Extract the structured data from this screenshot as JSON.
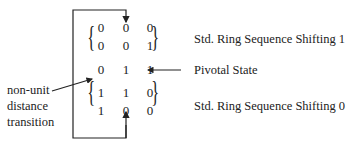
{
  "diagram": {
    "rows": [
      {
        "bits": [
          "0",
          "0",
          "0"
        ],
        "group": "shift1"
      },
      {
        "bits": [
          "0",
          "0",
          "1"
        ],
        "group": "shift1"
      },
      {
        "bits": [
          "0",
          "1",
          "1"
        ],
        "group": "pivot"
      },
      {
        "bits": [
          "1",
          "1",
          "0"
        ],
        "group": "shift0"
      },
      {
        "bits": [
          "1",
          "0",
          "0"
        ],
        "group": "shift0"
      }
    ],
    "labels": {
      "shift1": "Std. Ring Sequence Shifting 1",
      "pivot": "Pivotal State",
      "shift0": "Std. Ring Sequence Shifting 0",
      "transition_line1": "non-unit",
      "transition_line2": "distance",
      "transition_line3": "transition"
    }
  }
}
